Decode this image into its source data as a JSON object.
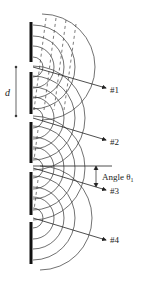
{
  "diagram": {
    "labels": {
      "spacing": "d",
      "ray1": "#1",
      "ray2": "#2",
      "ray3": "#3",
      "ray4": "#4",
      "angle": "Angle θ",
      "angle_subscript": "1"
    },
    "barriers": [
      {
        "y1": 22,
        "y2": 62
      },
      {
        "y1": 72,
        "y2": 114
      },
      {
        "y1": 122,
        "y2": 163
      },
      {
        "y1": 172,
        "y2": 215
      },
      {
        "y1": 222,
        "y2": 264
      }
    ],
    "slits_y": [
      67,
      118,
      168,
      218
    ],
    "colors": {
      "line": "#222222",
      "barrier": "#111111",
      "background": "#ffffff"
    }
  }
}
